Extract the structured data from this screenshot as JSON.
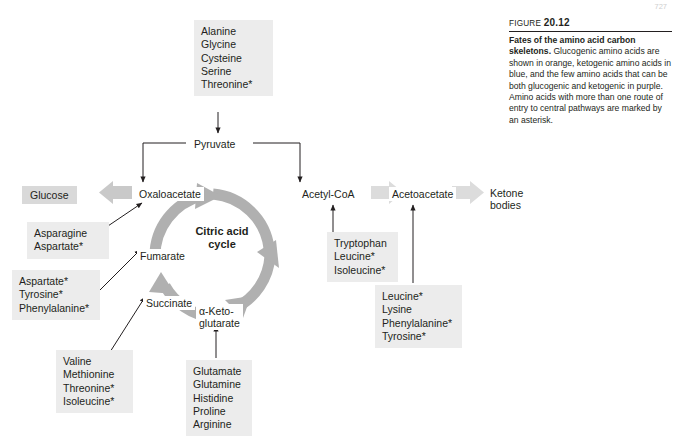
{
  "page": {
    "number": "727"
  },
  "caption": {
    "figure_word": "FIGURE",
    "figure_number": "20.12",
    "title": "Fates of the amino acid carbon skeletons.",
    "body": "Glucogenic amino acids are shown in orange, ketogenic amino acids in blue, and the few amino acids that can be both glucogenic and ketogenic in purple. Amino acids with more than one route of entry to central pathways are marked by an asterisk."
  },
  "nodes": {
    "pyruvate": "Pyruvate",
    "oxaloacetate": "Oxaloacetate",
    "fumarate": "Fumarate",
    "succinate": "Succinate",
    "alpha_ketoglutarate": "α-Keto-\nglutarate",
    "acetyl_coa": "Acetyl-CoA",
    "acetoacetate": "Acetoacetate",
    "ketone_bodies": "Ketone\nbodies",
    "glucose": "Glucose",
    "cycle_title": "Citric acid\ncycle"
  },
  "amino_acid_groups": {
    "to_pyruvate": "Alanine\nGlycine\nCysteine\nSerine\nThreonine*",
    "to_oxaloacetate": "Asparagine\nAspartate*",
    "to_fumarate": "Aspartate*\nTyrosine*\nPhenylalanine*",
    "to_succinate": "Valine\nMethionine\nThreonine*\nIsoleucine*",
    "to_alpha_ketoglutarate": "Glutamate\nGlutamine\nHistidine\nProline\nArginine",
    "to_acetyl_coa": "Tryptophan\nLeucine*\nIsoleucine*",
    "to_acetoacetate": "Leucine*\nLysine\nPhenylalanine*\nTyrosine*"
  },
  "colors": {
    "box_fill": "#ececec",
    "node_box_fill": "#d9d9d9",
    "thick_arrow": "#bfbfbf",
    "cycle_arrow": "#b3b3b3",
    "line": "#231f20"
  }
}
